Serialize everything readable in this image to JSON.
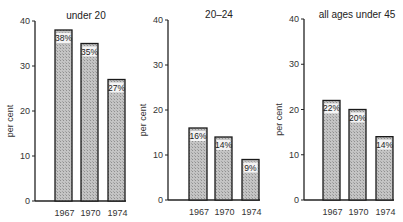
{
  "chart_data": [
    {
      "type": "bar",
      "title": "under 20",
      "xlabel": "",
      "ylabel": "per cent",
      "categories": [
        "1967",
        "1970",
        "1974"
      ],
      "values": [
        38,
        35,
        27
      ],
      "labels": [
        "38%",
        "35%",
        "27%"
      ],
      "ylim": [
        0,
        40
      ],
      "yticks": [
        0,
        10,
        20,
        30,
        40
      ],
      "grid": false
    },
    {
      "type": "bar",
      "title": "20–24",
      "xlabel": "",
      "ylabel": "per cent",
      "categories": [
        "1967",
        "1970",
        "1974"
      ],
      "values": [
        16,
        14,
        9
      ],
      "labels": [
        "16%",
        "14%",
        "9%"
      ],
      "ylim": [
        0,
        40
      ],
      "yticks": [
        0,
        10,
        20,
        30,
        40
      ],
      "grid": false
    },
    {
      "type": "bar",
      "title": "all ages under 45",
      "xlabel": "",
      "ylabel": "per cent",
      "categories": [
        "1967",
        "1970",
        "1974"
      ],
      "values": [
        22,
        20,
        14
      ],
      "labels": [
        "22%",
        "20%",
        "14%"
      ],
      "ylim": [
        0,
        40
      ],
      "yticks": [
        0,
        10,
        20,
        30,
        40
      ],
      "grid": false
    }
  ],
  "colors": {
    "axis": "#222222",
    "bar_fill": "#bdbdbd",
    "bar_stroke": "#1a1a1a",
    "label_bg": "#f4f4f4"
  }
}
